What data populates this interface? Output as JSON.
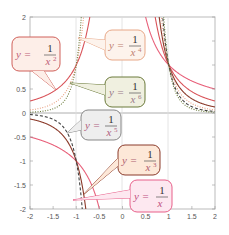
{
  "chart_data": {
    "type": "line",
    "title": "",
    "xlabel": "",
    "ylabel": "",
    "xlim": [
      -2,
      2
    ],
    "ylim": [
      -2,
      2
    ],
    "grid": false,
    "x_ticks": [
      "-2",
      "-1.5",
      "-1",
      "-0.5",
      "0",
      "0.5",
      "1",
      "1.5",
      "2"
    ],
    "y_ticks": [
      "2",
      "1.5",
      "1",
      "0.5",
      "0",
      "-0.5",
      "-1",
      "-1.5",
      "-2"
    ],
    "reference_lines": {
      "x": [
        0,
        -1,
        1
      ],
      "y": [
        0
      ]
    },
    "series": [
      {
        "name": "y = 1/x",
        "exponent": 1,
        "color": "#e8607a",
        "style": "solid"
      },
      {
        "name": "y = 1/x^2",
        "exponent": 2,
        "color": "#d9545a",
        "style": "solid"
      },
      {
        "name": "y = 1/x^3",
        "exponent": 3,
        "color": "#8b3a2a",
        "style": "solid"
      },
      {
        "name": "y = 1/x^4",
        "exponent": 4,
        "color": "#e8a080",
        "style": "dotted"
      },
      {
        "name": "y = 1/x^5",
        "exponent": 5,
        "color": "#444444",
        "style": "dashed"
      },
      {
        "name": "y = 1/x^6",
        "exponent": 6,
        "color": "#6b7a3a",
        "style": "dotted"
      }
    ],
    "annotations": [
      {
        "text": "y = 1/x^2",
        "num": "1",
        "den": "x",
        "exp": "2",
        "fill": "#fdeee8",
        "stroke": "#d0605a",
        "text_color": "#c06078"
      },
      {
        "text": "y = 1/x^4",
        "num": "1",
        "den": "x",
        "exp": "4",
        "fill": "#fdf3ec",
        "stroke": "#e8a888",
        "text_color": "#c08070"
      },
      {
        "text": "y = 1/x^6",
        "num": "1",
        "den": "x",
        "exp": "6",
        "fill": "#f0f0e0",
        "stroke": "#6b7a3a",
        "text_color": "#9a7a8a"
      },
      {
        "text": "y = 1/x^5",
        "num": "1",
        "den": "x",
        "exp": "5",
        "fill": "#eeeeee",
        "stroke": "#888888",
        "text_color": "#b06080"
      },
      {
        "text": "y = 1/x^3",
        "num": "1",
        "den": "x",
        "exp": "3",
        "fill": "#fde8d8",
        "stroke": "#8b3a2a",
        "text_color": "#b06070"
      },
      {
        "text": "y = 1/x",
        "num": "1",
        "den": "x",
        "exp": "",
        "fill": "#fde8f0",
        "stroke": "#e8608a",
        "text_color": "#c05080"
      }
    ]
  },
  "labels": {
    "y_eq": "y =",
    "one": "1",
    "x": "x",
    "e2": "2",
    "e3": "3",
    "e4": "4",
    "e5": "5",
    "e6": "6"
  }
}
